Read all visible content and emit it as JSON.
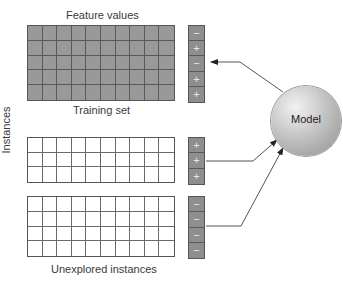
{
  "labels": {
    "feature_values": "Feature values",
    "training_set": "Training set",
    "instances": "Instances",
    "unexplored": "Unexplored instances",
    "model": "Model"
  },
  "grids": {
    "training": {
      "rows": 5,
      "cols": 10,
      "style": "shaded",
      "signs": [
        "−",
        "+",
        "−",
        "+",
        "+"
      ]
    },
    "middle": {
      "rows": 3,
      "cols": 10,
      "style": "plain",
      "signs": [
        "+",
        "+",
        "+"
      ]
    },
    "bottom": {
      "rows": 4,
      "cols": 10,
      "style": "plain",
      "signs": [
        "−",
        "−",
        "−",
        "−"
      ]
    }
  },
  "arrows": [
    {
      "from": "model",
      "to": "training-signs"
    },
    {
      "from": "middle-signs",
      "to": "model"
    },
    {
      "from": "bottom-signs",
      "to": "model"
    }
  ]
}
